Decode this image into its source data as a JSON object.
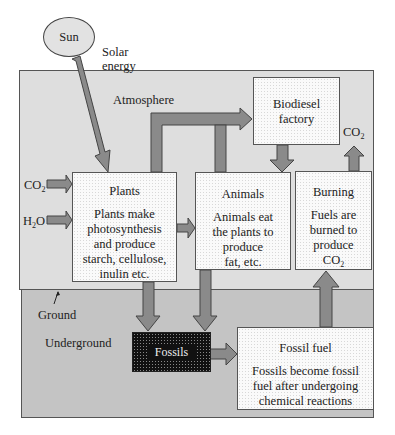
{
  "sun": {
    "label": "Sun"
  },
  "solar_energy": {
    "line1": "Solar",
    "line2": "energy"
  },
  "zones": {
    "atmosphere": "Atmosphere",
    "ground": "Ground",
    "underground": "Underground"
  },
  "inputs": {
    "co2": {
      "base": "CO",
      "sub": "2"
    },
    "h2o": {
      "pre": "H",
      "sub": "2",
      "post": "O"
    }
  },
  "output_co2": {
    "base": "CO",
    "sub": "2"
  },
  "nodes": {
    "biodiesel": {
      "line1": "Biodiesel",
      "line2": "factory"
    },
    "plants": {
      "title": "Plants",
      "lines": [
        "Plants make",
        "photosynthesis",
        "and produce",
        "starch, cellulose,",
        "inulin etc."
      ]
    },
    "animals": {
      "title": "Animals",
      "lines": [
        "Animals eat",
        "the plants to",
        "produce",
        "fat, etc."
      ]
    },
    "burning": {
      "title": "Burning",
      "lines": [
        "Fuels are",
        "burned to",
        "produce"
      ],
      "last_base": "CO",
      "last_sub": "2"
    },
    "fossils": {
      "label": "Fossils"
    },
    "fossil_fuel": {
      "title": "Fossil fuel",
      "lines": [
        "Fossils become fossil",
        "fuel after undergoing",
        "chemical reactions"
      ]
    }
  },
  "colors": {
    "atmosphere_bg": "#dedede",
    "underground_bg": "#c4c4c4",
    "arrow_fill": "#8a8a8a",
    "arrow_stroke": "#444444",
    "fossils_bg": "#111111"
  }
}
